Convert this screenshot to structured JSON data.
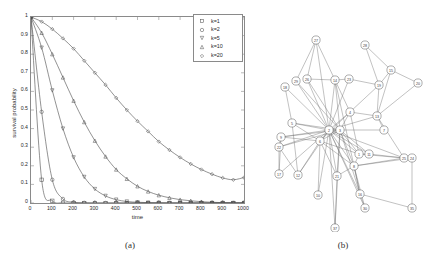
{
  "figure": {
    "caption_a": "(a)",
    "caption_b": "(b)"
  },
  "chart_data": [
    {
      "type": "line",
      "panel": "(a)",
      "title": "",
      "xlabel": "time",
      "ylabel": "survival probability",
      "xlim": [
        0,
        1000
      ],
      "ylim": [
        0,
        1
      ],
      "xticks": [
        0,
        100,
        200,
        300,
        400,
        500,
        600,
        700,
        800,
        900,
        1000
      ],
      "yticks": [
        0,
        0.1,
        0.2,
        0.3,
        0.4,
        0.5,
        0.6,
        0.7,
        0.8,
        0.9,
        1
      ],
      "xtick_labels": [
        "0",
        "100",
        "200",
        "300",
        "400",
        "500",
        "600",
        "700",
        "800",
        "900",
        "1000"
      ],
      "ytick_labels": [
        "0",
        "0.1",
        "0.2",
        "0.3",
        "0.4",
        "0.5",
        "0.6",
        "0.7",
        "0.8",
        "0.9",
        "1"
      ],
      "grid": false,
      "legend_position": "top-right",
      "marker_interval": 50,
      "series": [
        {
          "name": "k=1",
          "marker": "square",
          "color": "#4a4a4a",
          "x": [
            0,
            50,
            100,
            150,
            200,
            250,
            300,
            350,
            400,
            450,
            500,
            550,
            600,
            650,
            700,
            750,
            800,
            850,
            900,
            950,
            1000
          ],
          "values": [
            1,
            0.125,
            0.012,
            0.001,
            0,
            0,
            0,
            0,
            0,
            0,
            0,
            0,
            0,
            0,
            0,
            0,
            0,
            0,
            0,
            0,
            0
          ]
        },
        {
          "name": "k=2",
          "marker": "circle",
          "color": "#4a4a4a",
          "x": [
            0,
            50,
            100,
            150,
            200,
            250,
            300,
            350,
            400,
            450,
            500,
            550,
            600,
            650,
            700,
            750,
            800,
            850,
            900,
            950,
            1000
          ],
          "values": [
            1,
            0.49,
            0.125,
            0.022,
            0.004,
            0.001,
            0,
            0,
            0,
            0,
            0,
            0,
            0,
            0,
            0,
            0,
            0,
            0,
            0,
            0,
            0
          ]
        },
        {
          "name": "k=5",
          "marker": "triangle-down",
          "color": "#4a4a4a",
          "x": [
            0,
            50,
            100,
            150,
            200,
            250,
            300,
            350,
            400,
            450,
            500,
            550,
            600,
            650,
            700,
            750,
            800,
            850,
            900,
            950,
            1000
          ],
          "values": [
            1,
            0.835,
            0.605,
            0.4,
            0.245,
            0.14,
            0.075,
            0.038,
            0.018,
            0.008,
            0.004,
            0.002,
            0.001,
            0,
            0,
            0,
            0,
            0,
            0,
            0,
            0
          ]
        },
        {
          "name": "k=10",
          "marker": "triangle-up",
          "color": "#4a4a4a",
          "x": [
            0,
            50,
            100,
            150,
            200,
            250,
            300,
            350,
            400,
            450,
            500,
            550,
            600,
            650,
            700,
            750,
            800,
            850,
            900,
            950,
            1000
          ],
          "values": [
            1,
            0.915,
            0.8,
            0.675,
            0.55,
            0.435,
            0.335,
            0.25,
            0.18,
            0.13,
            0.09,
            0.062,
            0.042,
            0.028,
            0.018,
            0.012,
            0.007,
            0.004,
            0.002,
            0.001,
            0
          ]
        },
        {
          "name": "k=20",
          "marker": "diamond",
          "color": "#4a4a4a",
          "x": [
            0,
            50,
            100,
            150,
            200,
            250,
            300,
            350,
            400,
            450,
            500,
            550,
            600,
            650,
            700,
            750,
            800,
            850,
            900,
            950,
            1000
          ],
          "values": [
            1,
            0.975,
            0.935,
            0.885,
            0.83,
            0.765,
            0.7,
            0.635,
            0.565,
            0.5,
            0.44,
            0.385,
            0.33,
            0.285,
            0.245,
            0.21,
            0.18,
            0.155,
            0.135,
            0.125,
            0.137
          ]
        }
      ]
    },
    {
      "type": "graph",
      "panel": "(b)",
      "title": "",
      "node_count": 30,
      "nodes": [
        {
          "id": "27",
          "x": 61,
          "y": 32
        },
        {
          "id": "26",
          "x": 52,
          "y": 71
        },
        {
          "id": "29",
          "x": 41,
          "y": 73
        },
        {
          "id": "14",
          "x": 80,
          "y": 72
        },
        {
          "id": "23",
          "x": 94,
          "y": 71
        },
        {
          "id": "28",
          "x": 110,
          "y": 37
        },
        {
          "id": "15",
          "x": 136,
          "y": 62
        },
        {
          "id": "19",
          "x": 124,
          "y": 77
        },
        {
          "id": "20",
          "x": 163,
          "y": 75
        },
        {
          "id": "18",
          "x": 30,
          "y": 79
        },
        {
          "id": "5",
          "x": 37,
          "y": 115
        },
        {
          "id": "9",
          "x": 26,
          "y": 129
        },
        {
          "id": "22",
          "x": 24,
          "y": 139
        },
        {
          "id": "17",
          "x": 24,
          "y": 166
        },
        {
          "id": "12",
          "x": 43,
          "y": 167
        },
        {
          "id": "4",
          "x": 95,
          "y": 104
        },
        {
          "id": "13",
          "x": 122,
          "y": 108
        },
        {
          "id": "7",
          "x": 129,
          "y": 122
        },
        {
          "id": "2",
          "x": 74,
          "y": 122
        },
        {
          "id": "3",
          "x": 85,
          "y": 122
        },
        {
          "id": "6",
          "x": 65,
          "y": 133
        },
        {
          "id": "1",
          "x": 104,
          "y": 146
        },
        {
          "id": "11",
          "x": 114,
          "y": 146
        },
        {
          "id": "8",
          "x": 99,
          "y": 158
        },
        {
          "id": "25",
          "x": 149,
          "y": 150
        },
        {
          "id": "24",
          "x": 157,
          "y": 150
        },
        {
          "id": "21",
          "x": 82,
          "y": 168
        },
        {
          "id": "10",
          "x": 63,
          "y": 187
        },
        {
          "id": "16",
          "x": 105,
          "y": 186
        },
        {
          "id": "30",
          "x": 110,
          "y": 200
        },
        {
          "id": "35",
          "x": 157,
          "y": 200
        },
        {
          "id": "37",
          "x": 80,
          "y": 220
        }
      ],
      "edges": [
        [
          "27",
          "26"
        ],
        [
          "27",
          "29"
        ],
        [
          "27",
          "14"
        ],
        [
          "27",
          "2"
        ],
        [
          "26",
          "14"
        ],
        [
          "26",
          "2"
        ],
        [
          "26",
          "3"
        ],
        [
          "29",
          "2"
        ],
        [
          "29",
          "3"
        ],
        [
          "14",
          "23"
        ],
        [
          "14",
          "2"
        ],
        [
          "14",
          "3"
        ],
        [
          "14",
          "4"
        ],
        [
          "14",
          "8"
        ],
        [
          "23",
          "2"
        ],
        [
          "23",
          "19"
        ],
        [
          "28",
          "19"
        ],
        [
          "28",
          "15"
        ],
        [
          "15",
          "19"
        ],
        [
          "15",
          "20"
        ],
        [
          "15",
          "13"
        ],
        [
          "19",
          "13"
        ],
        [
          "19",
          "4"
        ],
        [
          "20",
          "13"
        ],
        [
          "13",
          "4"
        ],
        [
          "13",
          "7"
        ],
        [
          "13",
          "2"
        ],
        [
          "13",
          "25"
        ],
        [
          "4",
          "2"
        ],
        [
          "4",
          "3"
        ],
        [
          "4",
          "6"
        ],
        [
          "4",
          "1"
        ],
        [
          "18",
          "5"
        ],
        [
          "18",
          "2"
        ],
        [
          "5",
          "2"
        ],
        [
          "5",
          "3"
        ],
        [
          "5",
          "6"
        ],
        [
          "5",
          "12"
        ],
        [
          "9",
          "2"
        ],
        [
          "9",
          "3"
        ],
        [
          "9",
          "6"
        ],
        [
          "9",
          "17"
        ],
        [
          "9",
          "22"
        ],
        [
          "22",
          "2"
        ],
        [
          "22",
          "3"
        ],
        [
          "22",
          "12"
        ],
        [
          "22",
          "17"
        ],
        [
          "17",
          "2"
        ],
        [
          "12",
          "2"
        ],
        [
          "12",
          "6"
        ],
        [
          "2",
          "3"
        ],
        [
          "2",
          "6"
        ],
        [
          "2",
          "1"
        ],
        [
          "2",
          "8"
        ],
        [
          "2",
          "11"
        ],
        [
          "2",
          "21"
        ],
        [
          "2",
          "10"
        ],
        [
          "2",
          "16"
        ],
        [
          "2",
          "7"
        ],
        [
          "2",
          "25"
        ],
        [
          "2",
          "30"
        ],
        [
          "2",
          "37"
        ],
        [
          "3",
          "6"
        ],
        [
          "3",
          "1"
        ],
        [
          "3",
          "8"
        ],
        [
          "3",
          "11"
        ],
        [
          "3",
          "21"
        ],
        [
          "3",
          "16"
        ],
        [
          "6",
          "21"
        ],
        [
          "6",
          "10"
        ],
        [
          "6",
          "8"
        ],
        [
          "6",
          "1"
        ],
        [
          "1",
          "11"
        ],
        [
          "1",
          "8"
        ],
        [
          "1",
          "25"
        ],
        [
          "8",
          "25"
        ],
        [
          "8",
          "24"
        ],
        [
          "8",
          "16"
        ],
        [
          "11",
          "25"
        ],
        [
          "25",
          "24"
        ],
        [
          "24",
          "35"
        ],
        [
          "21",
          "8"
        ],
        [
          "21",
          "37"
        ],
        [
          "16",
          "30"
        ],
        [
          "16",
          "35"
        ],
        [
          "16",
          "8"
        ],
        [
          "30",
          "8"
        ],
        [
          "37",
          "3"
        ]
      ]
    }
  ]
}
